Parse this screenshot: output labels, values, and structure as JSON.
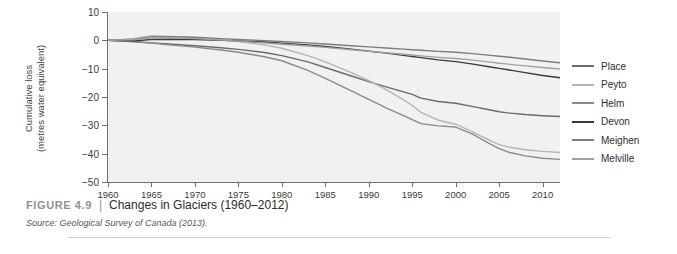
{
  "figure": {
    "number_label": "FIGURE 4.9",
    "separator": "|",
    "title": "Changes in Glaciers (1960–2012)",
    "source": "Source: Geological Survey of Canada (2013)."
  },
  "chart_data": {
    "type": "line",
    "title": "Changes in Glaciers (1960–2012)",
    "xlabel": "",
    "ylabel": "Cumulative loss\n(metres water equivalent)",
    "ylabel_line1": "Cumulative loss",
    "ylabel_line2": "(metres water equivalent)",
    "xlim": [
      1960,
      2012
    ],
    "ylim": [
      -50,
      10
    ],
    "yticks": [
      10,
      0,
      -10,
      -20,
      -30,
      -40,
      -50
    ],
    "ytick_labels": [
      "10",
      "0",
      "−10",
      "−20",
      "−30",
      "−40",
      "−50"
    ],
    "xticks": [
      1960,
      1965,
      1970,
      1975,
      1980,
      1985,
      1990,
      1995,
      2000,
      2005,
      2010
    ],
    "xtick_labels": [
      "1960",
      "1965",
      "1970",
      "1975",
      "1980",
      "1985",
      "1990",
      "1995",
      "2000",
      "2005",
      "2010"
    ],
    "grid": false,
    "legend_position": "right",
    "x": [
      1960,
      1963,
      1965,
      1967,
      1970,
      1973,
      1975,
      1978,
      1980,
      1983,
      1985,
      1988,
      1990,
      1992,
      1994,
      1995,
      1996,
      1998,
      2000,
      2002,
      2004,
      2005,
      2006,
      2008,
      2010,
      2012
    ],
    "series": [
      {
        "name": "Place",
        "color": "#6b6b6b",
        "values": [
          0,
          -0.4,
          -0.9,
          -1.3,
          -1.9,
          -2.6,
          -3.2,
          -4.3,
          -5.4,
          -7.6,
          -9.6,
          -12.6,
          -14.6,
          -16.4,
          -18.2,
          -19.1,
          -20.4,
          -21.6,
          -22.2,
          -23.4,
          -24.6,
          -25.2,
          -25.6,
          -26.2,
          -26.6,
          -26.9
        ]
      },
      {
        "name": "Peyto",
        "color": "#b4b4b4",
        "values": [
          0,
          0.6,
          1.6,
          1.4,
          0.9,
          0.2,
          -0.4,
          -1.6,
          -2.8,
          -5.4,
          -7.6,
          -11.4,
          -14.2,
          -17.4,
          -21.0,
          -23.0,
          -25.4,
          -28.2,
          -29.6,
          -32.4,
          -35.4,
          -36.8,
          -37.6,
          -38.6,
          -39.2,
          -39.6
        ]
      },
      {
        "name": "Helm",
        "color": "#8a8a8a",
        "values": [
          0,
          -0.5,
          -1.0,
          -1.6,
          -2.4,
          -3.4,
          -4.2,
          -5.8,
          -7.2,
          -10.6,
          -13.4,
          -17.8,
          -20.8,
          -23.8,
          -26.6,
          -28.0,
          -29.4,
          -30.2,
          -30.6,
          -33.2,
          -36.6,
          -38.2,
          -39.4,
          -40.8,
          -41.6,
          -42.0
        ]
      },
      {
        "name": "Devon",
        "color": "#3a3a3a",
        "values": [
          0,
          -0.2,
          0.3,
          0.4,
          0.3,
          0.0,
          -0.2,
          -0.6,
          -1.0,
          -1.6,
          -2.2,
          -3.1,
          -3.8,
          -4.5,
          -5.3,
          -5.7,
          -6.1,
          -6.9,
          -7.5,
          -8.4,
          -9.4,
          -9.9,
          -10.4,
          -11.4,
          -12.4,
          -13.2
        ]
      },
      {
        "name": "Meighen",
        "color": "#7d7d7d",
        "values": [
          0,
          0.4,
          1.2,
          1.3,
          1.1,
          0.6,
          0.3,
          -0.1,
          -0.4,
          -0.9,
          -1.3,
          -1.9,
          -2.3,
          -2.7,
          -3.1,
          -3.3,
          -3.5,
          -3.9,
          -4.2,
          -4.7,
          -5.3,
          -5.6,
          -5.9,
          -6.6,
          -7.3,
          -7.9
        ]
      },
      {
        "name": "Melville",
        "color": "#a0a0a0",
        "values": [
          0,
          0.3,
          0.9,
          0.9,
          0.6,
          0.1,
          -0.3,
          -0.9,
          -1.4,
          -2.0,
          -2.5,
          -3.3,
          -3.9,
          -4.4,
          -4.9,
          -5.2,
          -5.5,
          -6.0,
          -6.4,
          -7.0,
          -7.7,
          -8.1,
          -8.4,
          -9.0,
          -9.6,
          -10.1
        ]
      }
    ]
  }
}
